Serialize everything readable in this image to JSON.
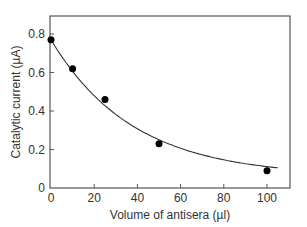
{
  "chart_data": {
    "type": "scatter",
    "title": "",
    "xlabel": "Volume of antisera (µl)",
    "ylabel": "Catalytic current (µA)",
    "xlim": [
      0,
      110
    ],
    "ylim": [
      0,
      0.9
    ],
    "x_ticks": [
      0,
      20,
      40,
      60,
      80,
      100
    ],
    "y_ticks": [
      0,
      0.2,
      0.4,
      0.6,
      0.8
    ],
    "x_tick_labels": [
      "0",
      "20",
      "40",
      "60",
      "80",
      "100"
    ],
    "y_tick_labels": [
      "0",
      "0.2",
      "0.4",
      "0.6",
      "0.8"
    ],
    "grid": false,
    "legend": null,
    "series": [
      {
        "name": "Measured",
        "marker": "filled-circle",
        "x": [
          0,
          10,
          25,
          50,
          100
        ],
        "y": [
          0.77,
          0.62,
          0.46,
          0.23,
          0.09
        ]
      },
      {
        "name": "Fitted curve",
        "style": "line",
        "x": [
          0,
          10,
          25,
          50,
          75,
          100,
          105
        ],
        "y": [
          0.77,
          0.63,
          0.46,
          0.27,
          0.15,
          0.095,
          0.09
        ]
      }
    ],
    "colors": {
      "axis": "#555555",
      "marker": "#000000",
      "curve": "#333333"
    }
  }
}
